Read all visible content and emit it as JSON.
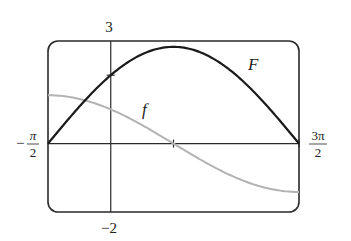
{
  "chart_data": {
    "type": "line",
    "title": "",
    "xlabel": "",
    "ylabel": "",
    "xlim": [
      -1.5708,
      4.7124
    ],
    "ylim": [
      -2,
      3
    ],
    "grid": false,
    "x_tick_labels": {
      "left_minus": "−",
      "left_num": "π",
      "left_den": "2",
      "right_num": "3π",
      "right_den": "2"
    },
    "y_tick_labels": {
      "top": "3",
      "bottom": "−2"
    },
    "x_ticks": [
      1.5708,
      4.7124
    ],
    "y_ticks": [
      2
    ],
    "series": [
      {
        "name": "F",
        "label": "F",
        "color": "#1a1a1a",
        "formula": "2*sqrt(2)*sin(x/2 + pi/4)",
        "x": [
          -1.5708,
          -0.7854,
          0,
          0.7854,
          1.5708,
          2.3562,
          3.1416,
          3.927,
          4.7124
        ],
        "y": [
          0,
          1.08,
          2.0,
          2.61,
          2.83,
          2.61,
          2.0,
          1.08,
          0
        ]
      },
      {
        "name": "f",
        "label": "f",
        "color": "#b0b0b0",
        "formula": "sqrt(2)*cos(x/2 + pi/4)",
        "x": [
          -1.5708,
          -0.7854,
          0,
          0.7854,
          1.5708,
          2.3562,
          3.1416,
          3.927,
          4.7124
        ],
        "y": [
          1.41,
          1.31,
          1.0,
          0.54,
          0,
          -0.54,
          -1.0,
          -1.31,
          -1.41
        ]
      }
    ]
  }
}
